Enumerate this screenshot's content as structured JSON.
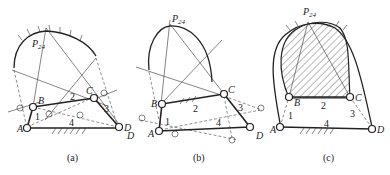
{
  "figure": {
    "panels": [
      {
        "id": "a",
        "caption": "(a)",
        "labels": {
          "pole": "P",
          "pole_sub": "24",
          "A": "A",
          "B": "B",
          "C": "C",
          "D": "D",
          "link1": "1",
          "link2": "2",
          "link3": "3",
          "link4": "4"
        }
      },
      {
        "id": "b",
        "caption": "(b)",
        "labels": {
          "pole": "P",
          "pole_sub": "24",
          "A": "A",
          "B": "B",
          "C": "C",
          "D": "D",
          "D2": "D",
          "link1": "1",
          "link2": "2",
          "link3": "3",
          "link4": "4"
        }
      },
      {
        "id": "c",
        "caption": "(c)",
        "labels": {
          "pole": "P",
          "pole_sub": "24",
          "A": "A",
          "B": "B",
          "C": "C",
          "D": "D",
          "link1": "1",
          "link2": "2",
          "link3": "3",
          "link4": "4"
        }
      }
    ]
  }
}
